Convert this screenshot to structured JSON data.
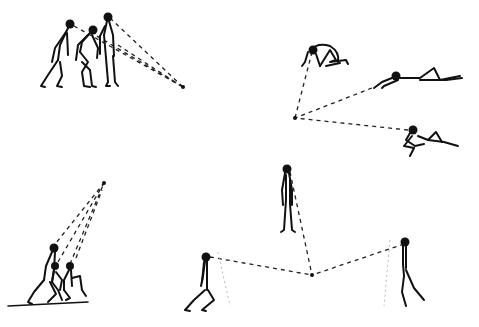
{
  "illustration": {
    "description": "Hand-drawn stick figures with dashed lines of sight converging on focal points",
    "ink_color": "#111111",
    "background_color": "#ffffff",
    "groups": [
      {
        "name": "standing-group-top-left",
        "figures": 3,
        "focal_point": [
          183,
          87
        ]
      },
      {
        "name": "reclining-group-top-right",
        "figures": 3,
        "focal_point": [
          295,
          118
        ]
      },
      {
        "name": "kneeling-group-bottom-left",
        "figures": 3,
        "focal_point": [
          104,
          183
        ]
      },
      {
        "name": "triangle-group-bottom-center",
        "figures": 3,
        "focal_point": [
          312,
          275
        ]
      }
    ]
  }
}
